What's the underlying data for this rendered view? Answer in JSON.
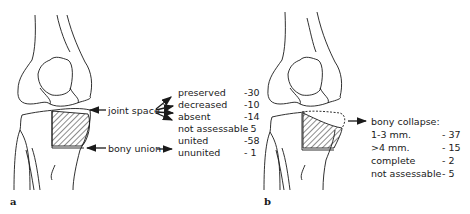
{
  "panel_a": {
    "letter": "a",
    "joint_space_label": "joint space",
    "bony_union_label": "bony union",
    "joint_space_items": [
      {
        "label": "preserved",
        "value": "-30"
      },
      {
        "label": "decreased",
        "value": "-10"
      },
      {
        "label": "absent",
        "value": "-14"
      },
      {
        "label": "not assessable",
        "value": "- 5"
      }
    ],
    "bony_union_items": [
      {
        "label": "united",
        "value": "-58"
      },
      {
        "label": "ununited",
        "value": "- 1"
      }
    ]
  },
  "panel_b": {
    "letter": "b",
    "title": "bony collapse:",
    "items": [
      {
        "label": "1-3 mm.",
        "value": "- 37"
      },
      {
        "label": ">4 mm.",
        "value": "- 15"
      },
      {
        "label": "complete",
        "value": "- 2"
      },
      {
        "label": "not assessable",
        "value": "- 5"
      }
    ]
  },
  "colors": {
    "ink": "#1a1a1a",
    "background": "#ffffff"
  }
}
